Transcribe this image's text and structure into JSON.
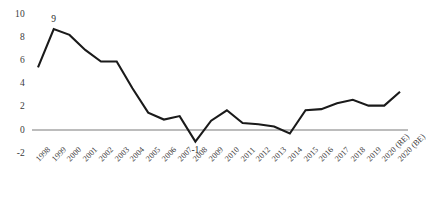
{
  "chart_data": {
    "type": "line",
    "title": "",
    "subtitle": "",
    "xlabel": "",
    "ylabel": "",
    "ylim": [
      -2,
      10
    ],
    "y_ticks": [
      -2,
      0,
      2,
      4,
      6,
      8,
      10
    ],
    "y_tick_labels": [
      "-2",
      "0",
      "2",
      "4",
      "6",
      "8",
      "10"
    ],
    "grid": false,
    "zero_line": true,
    "legend": "none",
    "line_color": "#1a1a1a",
    "zero_line_color": "#a6a6a6",
    "categories": [
      "1998",
      "1999",
      "2000",
      "2001",
      "2002",
      "2003",
      "2004",
      "2005",
      "2006",
      "2007",
      "2008",
      "2009",
      "2010",
      "2011",
      "2012",
      "2013",
      "2014",
      "2015",
      "2016",
      "2017",
      "2018",
      "2019",
      "2020 (RE)",
      "2020 (BE)"
    ],
    "values": [
      5.4,
      8.7,
      8.2,
      6.9,
      5.9,
      5.9,
      3.6,
      1.5,
      0.9,
      1.2,
      -1.0,
      0.8,
      1.7,
      0.6,
      0.5,
      0.3,
      -0.3,
      1.7,
      1.8,
      2.3,
      2.6,
      2.1,
      2.1,
      3.3
    ],
    "data_labels": [
      {
        "category": "1999",
        "value": 9,
        "text": "9"
      },
      {
        "category": "2008",
        "value": -1,
        "text": "-1"
      }
    ],
    "annotations": []
  }
}
